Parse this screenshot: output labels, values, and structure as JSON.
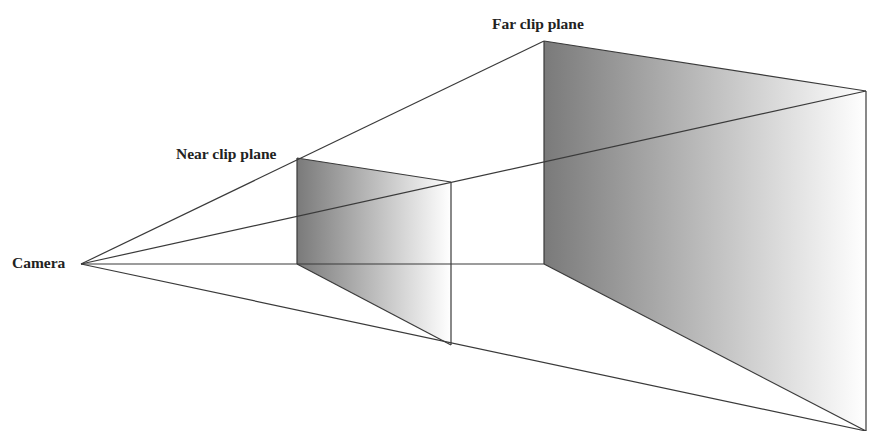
{
  "diagram": {
    "labels": {
      "camera": "Camera",
      "near_plane": "Near clip plane",
      "far_plane": "Far clip plane"
    },
    "colors": {
      "line": "#3a3a3a",
      "shade_dark": "#7a7a7a",
      "shade_light": "#ffffff"
    },
    "points": {
      "camera": [
        81,
        264
      ],
      "near": {
        "top_left": [
          297,
          158
        ],
        "top_right": [
          451,
          182
        ],
        "bottom_left": [
          297,
          264
        ],
        "bottom_right": [
          451,
          345
        ]
      },
      "far": {
        "top_left": [
          544,
          41
        ],
        "top_right": [
          866,
          91
        ],
        "bottom_left": [
          544,
          264
        ],
        "bottom_right": [
          866,
          431
        ]
      }
    }
  }
}
